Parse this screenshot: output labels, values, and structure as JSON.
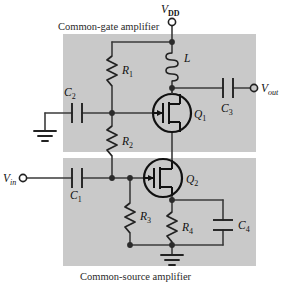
{
  "figure": {
    "type": "circuit-schematic",
    "title_top": "Common-gate amplifier",
    "title_bottom": "Common-source amplifier",
    "background": "#ffffff",
    "block_fill": "#c9c9c9",
    "wire_color": "#3b3b3b"
  },
  "terminals": {
    "vdd": {
      "label": "V",
      "sub": "DD"
    },
    "vout": {
      "label": "V",
      "sub": "out"
    },
    "vin": {
      "label": "V",
      "sub": "in"
    }
  },
  "components": {
    "r1": {
      "label": "R",
      "sub": "1"
    },
    "r2": {
      "label": "R",
      "sub": "2"
    },
    "r3": {
      "label": "R",
      "sub": "3"
    },
    "r4": {
      "label": "R",
      "sub": "4"
    },
    "c1": {
      "label": "C",
      "sub": "1"
    },
    "c2": {
      "label": "C",
      "sub": "2"
    },
    "c3": {
      "label": "C",
      "sub": "3"
    },
    "c4": {
      "label": "C",
      "sub": "4"
    },
    "l1": {
      "label": "L",
      "sub": ""
    },
    "q1": {
      "label": "Q",
      "sub": "1"
    },
    "q2": {
      "label": "Q",
      "sub": "2"
    }
  },
  "ground_symbols": [
    "ground-left",
    "ground-bottom"
  ]
}
